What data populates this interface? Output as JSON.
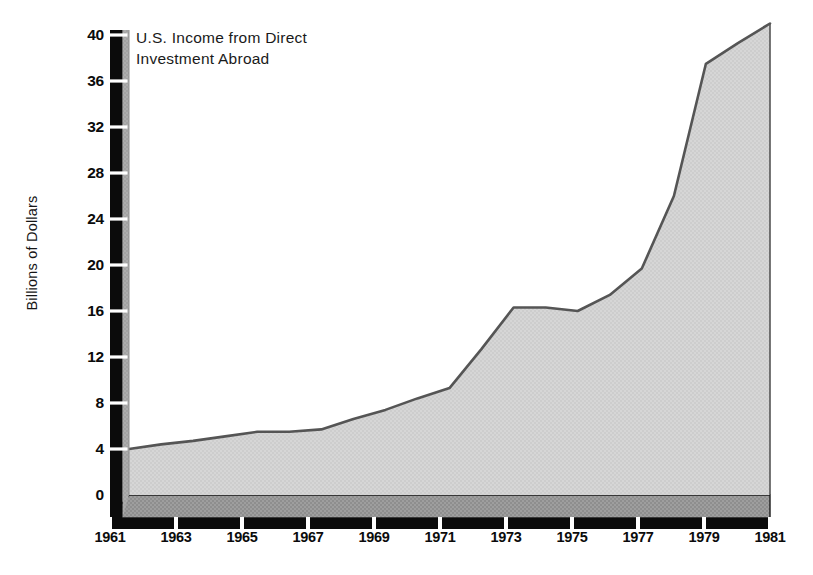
{
  "chart_data": {
    "type": "area",
    "title": "U.S. Income from Direct Investment Abroad",
    "title_line1": "U.S. Income from Direct",
    "title_line2": "Investment Abroad",
    "xlabel": "",
    "ylabel": "Billions of Dollars",
    "x": [
      1961,
      1962,
      1963,
      1964,
      1965,
      1966,
      1967,
      1968,
      1969,
      1970,
      1971,
      1972,
      1973,
      1974,
      1975,
      1976,
      1977,
      1978,
      1979,
      1980,
      1981
    ],
    "values": [
      4.0,
      4.4,
      4.7,
      5.1,
      5.5,
      5.5,
      5.7,
      6.6,
      7.4,
      8.4,
      9.3,
      12.7,
      16.3,
      16.3,
      16.0,
      17.4,
      19.7,
      26.0,
      37.5,
      39.3,
      41.0
    ],
    "xticks": [
      "1961",
      "1963",
      "1965",
      "1967",
      "1969",
      "1971",
      "1973",
      "1975",
      "1977",
      "1979",
      "1981"
    ],
    "xtick_values": [
      1961,
      1963,
      1965,
      1967,
      1969,
      1971,
      1973,
      1975,
      1977,
      1979,
      1981
    ],
    "yticks": [
      "0",
      "4",
      "8",
      "12",
      "16",
      "20",
      "24",
      "28",
      "32",
      "36",
      "40"
    ],
    "ytick_values": [
      0,
      4,
      8,
      12,
      16,
      20,
      24,
      28,
      32,
      36,
      40
    ],
    "xlim": [
      1961,
      1981
    ],
    "ylim": [
      0,
      40
    ],
    "grid": false,
    "legend": "none",
    "series_name": "U.S. Income from Direct Investment Abroad",
    "colors": {
      "area_fill": "#d3d3d3",
      "area_line": "#555555",
      "axis_black": "#0b0b0b",
      "axis_side": "#a8a8a8",
      "base_band": "#999999",
      "background": "#ffffff",
      "text": "#0b0b0b"
    },
    "annotations": [
      {
        "year": 1973,
        "note": "plateau begins"
      },
      {
        "year": 1975,
        "note": "slight dip"
      },
      {
        "year": 1979,
        "note": "steep rise"
      }
    ]
  }
}
